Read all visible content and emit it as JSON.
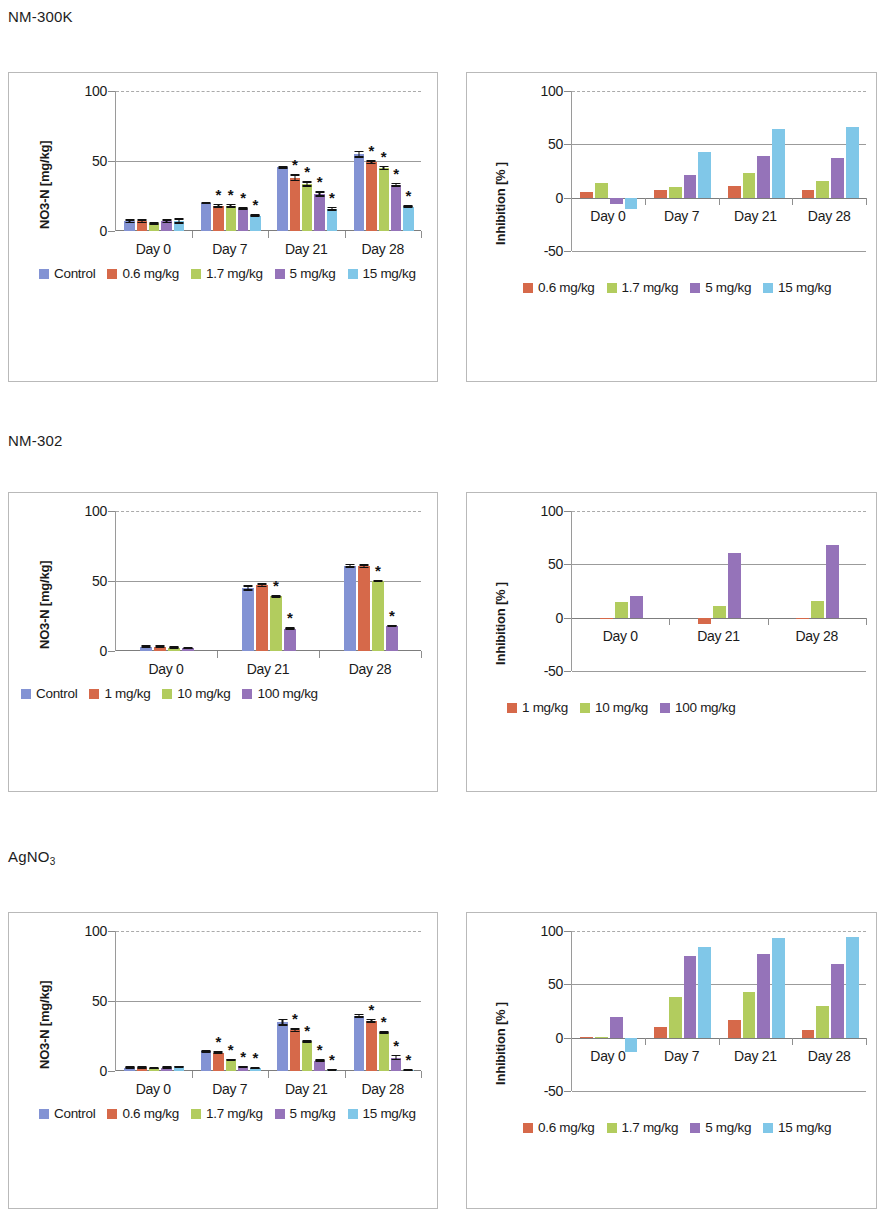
{
  "figure": {
    "sections": [
      {
        "title": "NM-300K",
        "title_sub": ""
      },
      {
        "title": "NM-302",
        "title_sub": ""
      },
      {
        "title": "AgNO",
        "title_sub": "3"
      }
    ]
  },
  "colors": {
    "control": "#8393d4",
    "dose1": "#d6694a",
    "dose2": "#b2cc5e",
    "dose3": "#9573b9",
    "dose4": "#80c7e8",
    "axis": "#8a8a8a",
    "grid": "#9b9b9b",
    "frame": "#b9b9b9"
  },
  "axis_titles": {
    "no3n": "NO3-N [mg/kg]",
    "inhibition": "Inhibition [% ]"
  },
  "chart_data": [
    {
      "id": "nm300k-no3n",
      "type": "bar",
      "title": "NM-300K",
      "xlabel": "",
      "ylabel": "NO3-N [mg/kg]",
      "ylim": [
        0,
        100
      ],
      "yticks": [
        0,
        50,
        100
      ],
      "grid": true,
      "legend_position": "below",
      "categories": [
        "Day 0",
        "Day 7",
        "Day 21",
        "Day 28"
      ],
      "series": [
        {
          "name": "Control",
          "color": "#8393d4",
          "values": [
            7,
            20,
            45.5,
            55
          ],
          "errors": [
            1.5,
            1,
            1,
            2.5
          ],
          "stars": [
            false,
            false,
            false,
            false
          ]
        },
        {
          "name": "0.6 mg/kg",
          "color": "#d6694a",
          "values": [
            7,
            18,
            38,
            49
          ],
          "errors": [
            1.5,
            1.5,
            2.5,
            1.5
          ],
          "stars": [
            false,
            true,
            true,
            true
          ]
        },
        {
          "name": "1.7 mg/kg",
          "color": "#b2cc5e",
          "values": [
            5.5,
            18,
            33.5,
            45
          ],
          "errors": [
            1,
            1.5,
            2,
            1.5
          ],
          "stars": [
            false,
            true,
            true,
            true
          ]
        },
        {
          "name": "5 mg/kg",
          "color": "#9573b9",
          "values": [
            7,
            16,
            26.5,
            33
          ],
          "errors": [
            1.5,
            1,
            2,
            1.5
          ],
          "stars": [
            false,
            true,
            true,
            true
          ]
        },
        {
          "name": "15 mg/kg",
          "color": "#80c7e8",
          "values": [
            7,
            11,
            16,
            17.5
          ],
          "errors": [
            2,
            1,
            1.5,
            1
          ],
          "stars": [
            false,
            true,
            true,
            true
          ]
        }
      ]
    },
    {
      "id": "nm300k-inhibition",
      "type": "bar",
      "title": "NM-300K",
      "xlabel": "",
      "ylabel": "Inhibition [% ]",
      "ylim": [
        -50,
        100
      ],
      "yticks": [
        -50,
        0,
        50,
        100
      ],
      "grid": true,
      "legend_position": "below",
      "categories": [
        "Day 0",
        "Day 7",
        "Day 21",
        "Day 28"
      ],
      "series": [
        {
          "name": "0.6 mg/kg",
          "color": "#d6694a",
          "values": [
            5,
            7,
            10.5,
            7
          ]
        },
        {
          "name": "1.7 mg/kg",
          "color": "#b2cc5e",
          "values": [
            14,
            10,
            23,
            16
          ]
        },
        {
          "name": "5 mg/kg",
          "color": "#9573b9",
          "values": [
            -6,
            21,
            39,
            37
          ]
        },
        {
          "name": "15 mg/kg",
          "color": "#80c7e8",
          "values": [
            -11,
            43,
            64,
            66
          ]
        }
      ]
    },
    {
      "id": "nm302-no3n",
      "type": "bar",
      "title": "NM-302",
      "xlabel": "",
      "ylabel": "NO3-N [mg/kg]",
      "ylim": [
        0,
        100
      ],
      "yticks": [
        0,
        50,
        100
      ],
      "grid": true,
      "legend_position": "below",
      "categories": [
        "Day 0",
        "Day 21",
        "Day 28"
      ],
      "series": [
        {
          "name": "Control",
          "color": "#8393d4",
          "values": [
            3,
            45,
            61
          ],
          "errors": [
            1,
            2,
            1.5
          ],
          "stars": [
            false,
            false,
            false
          ]
        },
        {
          "name": "1 mg/kg",
          "color": "#d6694a",
          "values": [
            3,
            47,
            60.5
          ],
          "errors": [
            1,
            1.5,
            1.5
          ],
          "stars": [
            false,
            false,
            false
          ]
        },
        {
          "name": "10 mg/kg",
          "color": "#b2cc5e",
          "values": [
            2.5,
            39,
            50
          ],
          "errors": [
            0.8,
            0.8,
            0.8
          ],
          "stars": [
            false,
            true,
            true
          ]
        },
        {
          "name": "100 mg/kg",
          "color": "#9573b9",
          "values": [
            2,
            16,
            18
          ],
          "errors": [
            0.8,
            0.8,
            0.8
          ],
          "stars": [
            false,
            true,
            true
          ]
        }
      ]
    },
    {
      "id": "nm302-inhibition",
      "type": "bar",
      "title": "NM-302",
      "xlabel": "",
      "ylabel": "Inhibition [% ]",
      "ylim": [
        -50,
        100
      ],
      "yticks": [
        -50,
        0,
        50,
        100
      ],
      "grid": true,
      "legend_position": "below",
      "categories": [
        "Day 0",
        "Day 21",
        "Day 28"
      ],
      "series": [
        {
          "name": "1 mg/kg",
          "color": "#d6694a",
          "values": [
            -1,
            -6,
            -1
          ]
        },
        {
          "name": "10 mg/kg",
          "color": "#b2cc5e",
          "values": [
            15,
            11,
            16
          ]
        },
        {
          "name": "100 mg/kg",
          "color": "#9573b9",
          "values": [
            20,
            61,
            68
          ]
        }
      ]
    },
    {
      "id": "agno3-no3n",
      "type": "bar",
      "title": "AgNO3",
      "xlabel": "",
      "ylabel": "NO3-N [mg/kg]",
      "ylim": [
        0,
        100
      ],
      "yticks": [
        0,
        50,
        100
      ],
      "grid": true,
      "legend_position": "below",
      "categories": [
        "Day 0",
        "Day 7",
        "Day 21",
        "Day 28"
      ],
      "series": [
        {
          "name": "Control",
          "color": "#8393d4",
          "values": [
            2.5,
            14,
            35,
            39.5
          ],
          "errors": [
            0.8,
            1,
            2.5,
            1.5
          ],
          "stars": [
            false,
            false,
            false,
            false
          ]
        },
        {
          "name": "0.6 mg/kg",
          "color": "#d6694a",
          "values": [
            2.5,
            13,
            29,
            36
          ],
          "errors": [
            0.8,
            1,
            1.5,
            1.5
          ],
          "stars": [
            false,
            true,
            true,
            true
          ]
        },
        {
          "name": "1.7 mg/kg",
          "color": "#b2cc5e",
          "values": [
            2,
            8,
            21,
            27.5
          ],
          "errors": [
            0.8,
            0.8,
            1,
            1
          ],
          "stars": [
            false,
            true,
            true,
            true
          ]
        },
        {
          "name": "5 mg/kg",
          "color": "#9573b9",
          "values": [
            2.5,
            3,
            7.5,
            9.5
          ],
          "errors": [
            0.8,
            0.8,
            1,
            2
          ],
          "stars": [
            false,
            true,
            true,
            true
          ]
        },
        {
          "name": "15 mg/kg",
          "color": "#80c7e8",
          "values": [
            3,
            2,
            1,
            0.8
          ],
          "errors": [
            0.8,
            0.8,
            0.5,
            0.5
          ],
          "stars": [
            false,
            true,
            true,
            true
          ]
        }
      ]
    },
    {
      "id": "agno3-inhibition",
      "type": "bar",
      "title": "AgNO3",
      "xlabel": "",
      "ylabel": "Inhibition [% ]",
      "ylim": [
        -50,
        100
      ],
      "yticks": [
        -50,
        0,
        50,
        100
      ],
      "grid": true,
      "legend_position": "below",
      "categories": [
        "Day 0",
        "Day 7",
        "Day 21",
        "Day 28"
      ],
      "series": [
        {
          "name": "0.6 mg/kg",
          "color": "#d6694a",
          "values": [
            0,
            10,
            17,
            7
          ]
        },
        {
          "name": "1.7 mg/kg",
          "color": "#b2cc5e",
          "values": [
            1,
            38,
            43,
            30
          ]
        },
        {
          "name": "5 mg/kg",
          "color": "#9573b9",
          "values": [
            19,
            77,
            78,
            69
          ]
        },
        {
          "name": "15 mg/kg",
          "color": "#80c7e8",
          "values": [
            -13,
            85,
            93,
            94
          ]
        }
      ]
    }
  ]
}
